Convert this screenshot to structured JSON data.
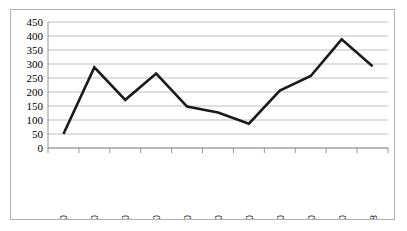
{
  "chart_data": {
    "type": "line",
    "title": "",
    "subtitle": "",
    "xlabel": "",
    "ylabel": "",
    "categories": [
      "1904–10",
      "1911–20",
      "1921–30",
      "1931–40",
      "1941–50",
      "1951–60",
      "1961–70",
      "1971–80",
      "1981–90",
      "1991–2000",
      "2001–8"
    ],
    "values": [
      50,
      288,
      172,
      266,
      148,
      127,
      87,
      205,
      257,
      388,
      292
    ],
    "series": [
      {
        "name": "",
        "values": [
          50,
          288,
          172,
          266,
          148,
          127,
          87,
          205,
          257,
          388,
          292
        ],
        "color": "#1a1a1a"
      }
    ],
    "ylim": [
      0,
      450
    ],
    "ytick_step": 50,
    "yticks": [
      0,
      50,
      100,
      150,
      200,
      250,
      300,
      350,
      400,
      450
    ],
    "ytick_labels": [
      "0",
      "50",
      "100",
      "150",
      "200",
      "250",
      "300",
      "350",
      "400",
      "450"
    ],
    "grid": "horizontal",
    "legend": "none",
    "annotations": [],
    "xtick_rotation": "vertical"
  },
  "frame": {
    "border_color": "#b0b0b0",
    "background_color": "#ffffff",
    "gridline_color": "#aeaeae",
    "axis_color": "#8a8a8a",
    "series_color": "#1a1a1a"
  }
}
